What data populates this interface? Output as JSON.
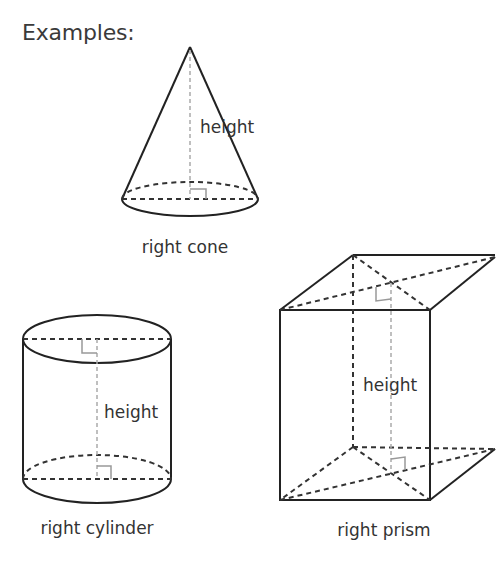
{
  "heading": "Examples:",
  "figures": [
    {
      "id": "cone",
      "name": "right cone",
      "dimension_label": "height"
    },
    {
      "id": "cylinder",
      "name": "right cylinder",
      "dimension_label": "height"
    },
    {
      "id": "prism",
      "name": "right prism",
      "dimension_label": "height"
    }
  ],
  "colors": {
    "solid_edge": "#222222",
    "hidden_edge": "#333333",
    "height_line": "#aaaaaa",
    "text": "#333333"
  }
}
